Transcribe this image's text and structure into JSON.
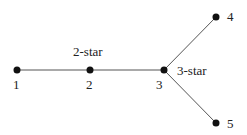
{
  "diagram": {
    "type": "graph",
    "nodes": [
      {
        "id": "1",
        "label": "1",
        "x": 17,
        "y": 70
      },
      {
        "id": "2",
        "label": "2",
        "x": 90,
        "y": 70
      },
      {
        "id": "3",
        "label": "3",
        "x": 164,
        "y": 70
      },
      {
        "id": "4",
        "label": "4",
        "x": 216,
        "y": 17
      },
      {
        "id": "5",
        "label": "5",
        "x": 216,
        "y": 123
      }
    ],
    "edges": [
      {
        "from": "1",
        "to": "2"
      },
      {
        "from": "2",
        "to": "3"
      },
      {
        "from": "3",
        "to": "4"
      },
      {
        "from": "3",
        "to": "5"
      }
    ],
    "annotations": {
      "two_star": "2-star",
      "three_star": "3-star"
    }
  }
}
